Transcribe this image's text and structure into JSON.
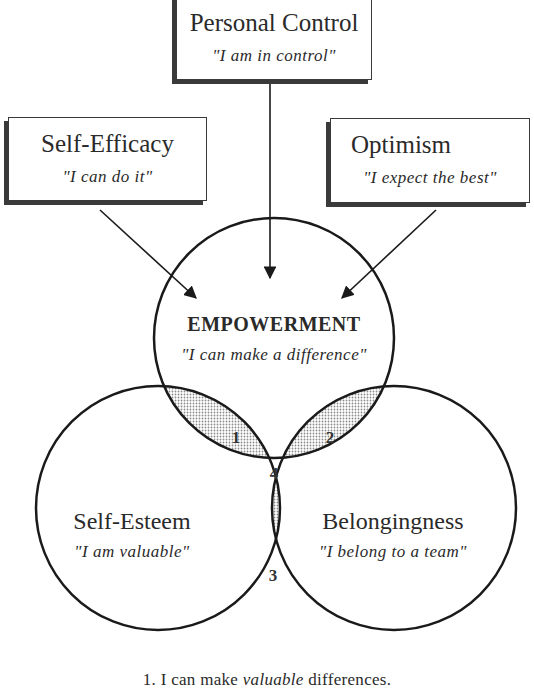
{
  "boxes": {
    "personal_control": {
      "title": "Personal Control",
      "quote": "\"I am in control\""
    },
    "self_efficacy": {
      "title": "Self-Efficacy",
      "quote": "\"I can do it\""
    },
    "optimism": {
      "title": "Optimism",
      "quote": "\"I expect the best\""
    }
  },
  "circles": {
    "empowerment": {
      "title": "EMPOWERMENT",
      "quote": "\"I can make a difference\""
    },
    "self_esteem": {
      "title": "Self-Esteem",
      "quote": "\"I am valuable\""
    },
    "belongingness": {
      "title": "Belongingness",
      "quote": "\"I belong to a team\""
    }
  },
  "regions": [
    "1",
    "2",
    "3",
    "4"
  ],
  "caption": {
    "number": "1.",
    "before": "I can make ",
    "emphasis": "valuable",
    "after": " differences."
  },
  "colors": {
    "line": "#1a1a1a",
    "shade_light": "#c8c8c8",
    "shade_dark": "#9a9a9a"
  }
}
